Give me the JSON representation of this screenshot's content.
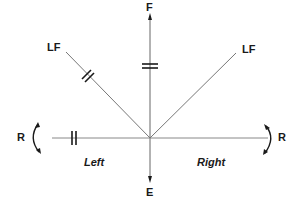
{
  "diagram": {
    "labels": {
      "forward": "F",
      "extension": "E",
      "lateral_flexion_left": "LF",
      "lateral_flexion_right": "LF",
      "rotation_left": "R",
      "rotation_right": "R",
      "side_left": "Left",
      "side_right": "Right"
    },
    "colors": {
      "line": "#7a7a7a",
      "ink": "#1a1a1a"
    }
  }
}
